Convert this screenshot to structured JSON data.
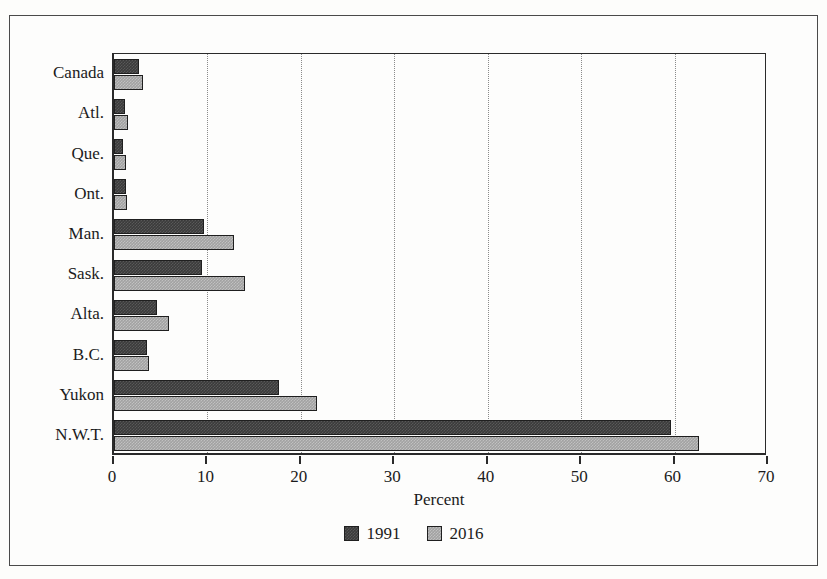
{
  "chart_data": {
    "type": "bar",
    "orientation": "horizontal",
    "title": "",
    "xlabel": "Percent",
    "ylabel": "",
    "xlim": [
      0,
      70
    ],
    "xticks": [
      0,
      10,
      20,
      30,
      40,
      50,
      60,
      70
    ],
    "xtick_labels": [
      "0",
      "10",
      "20",
      "30",
      "40",
      "50",
      "60",
      "70"
    ],
    "grid": "vertical-dotted",
    "legend_position": "bottom-center",
    "categories": [
      "Canada",
      "Atl.",
      "Que.",
      "Ont.",
      "Man.",
      "Sask.",
      "Alta.",
      "B.C.",
      "Yukon",
      "N.W.T."
    ],
    "series": [
      {
        "name": "1991",
        "color": "#3b3b3b",
        "values": [
          2.7,
          1.2,
          1.0,
          1.3,
          9.6,
          9.4,
          4.6,
          3.5,
          17.7,
          59.6
        ]
      },
      {
        "name": "2016",
        "color": "#a2a2a2",
        "values": [
          3.1,
          1.5,
          1.3,
          1.4,
          12.8,
          14.0,
          5.9,
          3.7,
          21.7,
          62.6
        ]
      }
    ]
  },
  "legend": {
    "items": [
      {
        "label": "1991",
        "key": "s1991"
      },
      {
        "label": "2016",
        "key": "s2016"
      }
    ]
  }
}
